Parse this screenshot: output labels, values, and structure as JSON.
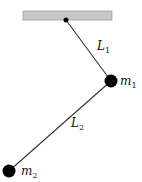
{
  "diagram": {
    "title": "",
    "type": "double pendulum",
    "support": {
      "x": 23,
      "y": 11,
      "width": 89,
      "height": 9,
      "fill": "#c8c8c8",
      "stroke": "#888888"
    },
    "pivot": {
      "x": 66,
      "y": 20,
      "r": 2.5
    },
    "rods": [
      {
        "name": "L",
        "sub": "1",
        "from": [
          66,
          20
        ],
        "to": [
          111,
          81
        ],
        "label_x": 97,
        "label_y": 50
      },
      {
        "name": "L",
        "sub": "2",
        "from": [
          111,
          81
        ],
        "to": [
          9,
          171
        ],
        "label_x": 71,
        "label_y": 127
      }
    ],
    "masses": [
      {
        "name": "m",
        "sub": "1",
        "x": 111,
        "y": 81,
        "r": 6.5,
        "label_x": 120,
        "label_y": 85
      },
      {
        "name": "m",
        "sub": "2",
        "x": 9,
        "y": 171,
        "r": 6.5,
        "label_x": 21,
        "label_y": 175
      }
    ],
    "colors": {
      "rod": "#333333",
      "mass": "#000000"
    }
  }
}
